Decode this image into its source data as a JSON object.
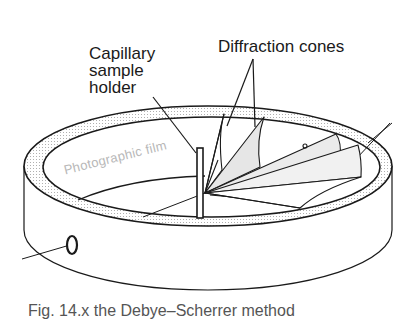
{
  "diagram": {
    "labels": {
      "capillary_line1": "Capillary",
      "capillary_line2": "sample",
      "capillary_line3": "holder",
      "diffraction_cones": "Diffraction cones",
      "photographic_film": "Photographic film"
    },
    "caption_partial": "Fig. 14.x  the Debye–Scherrer method"
  },
  "colors": {
    "ink": "#1a1a1a",
    "ring_shade": "#9a9a9a",
    "cone_fill": "#e4e4e4",
    "film_text": "#b8b8b8"
  }
}
